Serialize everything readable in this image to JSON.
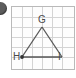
{
  "figure": {
    "type": "geometry-diagram",
    "bullet_marker": {
      "icon": "filled-circle-bullet",
      "label": ""
    },
    "grid": {
      "columns": 6,
      "rows": 6,
      "cell_size": 10,
      "line_color": "#d2d2d2",
      "border_color": "#b9b9b9",
      "background": "#fdfdfd"
    },
    "shape": {
      "name": "triangle-GHI",
      "stroke_color": "#555555",
      "vertices": [
        {
          "id": "G",
          "label": "G",
          "x": 31,
          "y": 21,
          "grid_x": 3,
          "grid_y": 2,
          "marker": false
        },
        {
          "id": "H",
          "label": "H",
          "x": 11,
          "y": 51,
          "grid_x": 1,
          "grid_y": 5,
          "marker": true
        },
        {
          "id": "I",
          "label": "I",
          "x": 51,
          "y": 51,
          "grid_x": 5,
          "grid_y": 5,
          "marker": false
        }
      ],
      "edges": [
        {
          "from": "H",
          "to": "G"
        },
        {
          "from": "G",
          "to": "I"
        },
        {
          "from": "H",
          "to": "I"
        }
      ]
    },
    "labels": {
      "G": "G",
      "H": "H",
      "I": "I"
    }
  }
}
